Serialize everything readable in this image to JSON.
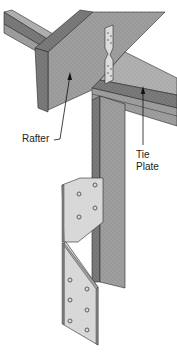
{
  "diagram": {
    "labels": {
      "rafter": "Rafter",
      "tie_line1": "Tie",
      "tie_line2": "Plate"
    },
    "colors": {
      "wood_top": "#a9a9a9",
      "wood_side": "#7c7c7c",
      "wood_face": "#9a9a9a",
      "metal": "#d9d9d9",
      "metal_edge": "#8a8a8a",
      "outline": "#2a2a2a",
      "hole": "#555555"
    },
    "connector": {
      "upper_holes": 6,
      "lower_holes": 10
    }
  }
}
